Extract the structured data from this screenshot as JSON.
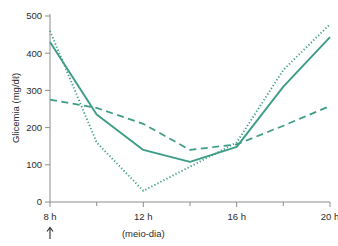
{
  "chart_data": {
    "type": "line",
    "title": "",
    "xlabel": "",
    "ylabel": "Glicemia (mg/dℓ)",
    "xlim": [
      8,
      20
    ],
    "ylim": [
      0,
      500
    ],
    "grid": false,
    "legend": "none",
    "x": [
      8,
      10,
      12,
      14,
      16,
      18,
      20
    ],
    "xtick_labels": [
      "8 h",
      "12 h",
      "16 h",
      "20 h"
    ],
    "xtick_values": [
      8,
      12,
      16,
      20
    ],
    "ytick_labels": [
      "0",
      "100",
      "200",
      "300",
      "400",
      "500"
    ],
    "ytick_values": [
      0,
      100,
      200,
      300,
      400,
      500
    ],
    "minor_xticks": [
      10,
      14,
      18
    ],
    "annotations": [
      {
        "text": "(meio-dia)",
        "x": 12,
        "position": "below-axis"
      },
      {
        "text": "↑",
        "x": 8,
        "position": "below-axis",
        "meaning": "injection-arrow"
      }
    ],
    "series": [
      {
        "name": "solid-curve",
        "style": "solid",
        "color": "#3c9c86",
        "values": [
          430,
          235,
          140,
          108,
          148,
          310,
          443
        ]
      },
      {
        "name": "dotted-curve",
        "style": "dotted",
        "color": "#3c9c86",
        "values": [
          460,
          160,
          30,
          95,
          160,
          355,
          478
        ]
      },
      {
        "name": "dashed-curve",
        "style": "dashed",
        "color": "#3c9c86",
        "values": [
          275,
          253,
          210,
          140,
          155,
          205,
          258
        ]
      }
    ]
  },
  "axis": {
    "y_title": "Glicemia (mg/dℓ)",
    "x_note": "(meio-dia)",
    "arrow_glyph": "↑"
  },
  "colors": {
    "line": "#3c9c86",
    "axis": "#8c8c8c",
    "text": "#2b2b2b",
    "background": "#ffffff"
  }
}
